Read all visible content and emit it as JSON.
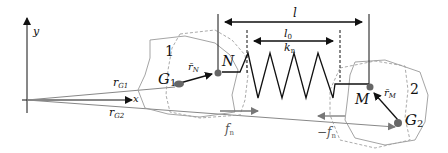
{
  "diagram": {
    "axes": {
      "x_label": "x",
      "y_label": "y"
    },
    "position_vectors": [
      {
        "label": "r",
        "subscript": "G1"
      },
      {
        "label": "r",
        "subscript": "G2"
      }
    ],
    "bodies": [
      {
        "id": "1",
        "centroid": "G",
        "centroid_sub": "1",
        "contact_point": "N",
        "offset_vector": "r̄",
        "offset_sub": "N"
      },
      {
        "id": "2",
        "centroid": "G",
        "centroid_sub": "2",
        "contact_point": "M",
        "offset_vector": "r̄",
        "offset_sub": "M"
      }
    ],
    "spring": {
      "current_length": "l",
      "rest_length": "l",
      "rest_length_sub": "0",
      "stiffness": "k",
      "stiffness_sub": "n"
    },
    "forces": [
      {
        "label": "f",
        "subscript": "n",
        "prefix": ""
      },
      {
        "label": "f",
        "subscript": "n",
        "prefix": "−"
      }
    ],
    "colors": {
      "line": "#111111",
      "outline": "#9a9a9a",
      "dashed": "#a0a0a0",
      "force": "#7a7a7a",
      "point": "#666666"
    }
  }
}
